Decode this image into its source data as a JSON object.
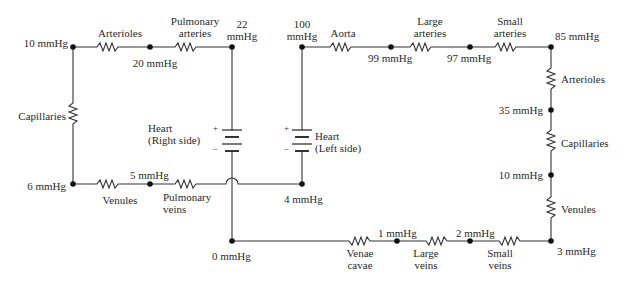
{
  "diagram": {
    "type": "circuit-analogy-circulatory-system",
    "pulmonary_loop": {
      "nodes": {
        "top_left": "10 mmHg",
        "arterioles_pulm_junction": "20 mmHg",
        "heart_right_top": "22\nmmHg",
        "bottom_left": "6 mmHg",
        "venules_pulmveins_junction": "5 mmHg",
        "heart_left_bottom": "4 mmHg"
      },
      "resistors": {
        "arterioles": "Arterioles",
        "pulmonary_arteries": "Pulmonary\narteries",
        "capillaries": "Capillaries",
        "venules": "Venules",
        "pulmonary_veins": "Pulmonary\nveins"
      },
      "heart_right": {
        "label": "Heart\n(Right side)",
        "plus": "+",
        "minus": "–"
      }
    },
    "systemic_loop": {
      "nodes": {
        "heart_left_top": "100\nmmHg",
        "aorta_large": "99 mmHg",
        "large_small": "97 mmHg",
        "top_right": "85 mmHg",
        "arterioles_capillaries": "35 mmHg",
        "capillaries_venules": "10 mmHg",
        "bottom_right": "3 mmHg",
        "small_large_veins": "2 mmHg",
        "large_veins_venae": "1 mmHg",
        "bottom_center": "0 mmHg"
      },
      "resistors": {
        "aorta": "Aorta",
        "large_arteries": "Large\narteries",
        "small_arteries": "Small\narteries",
        "arterioles": "Arterioles",
        "capillaries": "Capillaries",
        "venules": "Venules",
        "small_veins": "Small\nveins",
        "large_veins": "Large\nveins",
        "venae_cavae": "Venae\ncavae"
      },
      "heart_left": {
        "label": "Heart\n(Left side)",
        "plus": "+",
        "minus": "–"
      }
    }
  }
}
